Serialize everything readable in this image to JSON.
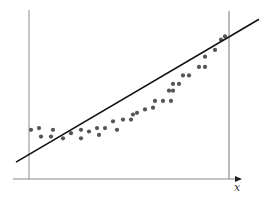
{
  "chart_data": {
    "type": "scatter",
    "title": "",
    "xlabel": "x",
    "ylabel": "",
    "grid": false,
    "legend": null,
    "xlim": [
      0,
      1
    ],
    "ylim": [
      0,
      1
    ],
    "series": [
      {
        "name": "observations",
        "kind": "points",
        "color": "#555555",
        "points": [
          [
            0.01,
            0.26
          ],
          [
            0.05,
            0.27
          ],
          [
            0.06,
            0.22
          ],
          [
            0.11,
            0.22
          ],
          [
            0.12,
            0.26
          ],
          [
            0.17,
            0.21
          ],
          [
            0.21,
            0.24
          ],
          [
            0.26,
            0.21
          ],
          [
            0.26,
            0.26
          ],
          [
            0.3,
            0.25
          ],
          [
            0.34,
            0.27
          ],
          [
            0.35,
            0.23
          ],
          [
            0.38,
            0.27
          ],
          [
            0.42,
            0.31
          ],
          [
            0.44,
            0.26
          ],
          [
            0.47,
            0.32
          ],
          [
            0.51,
            0.32
          ],
          [
            0.52,
            0.35
          ],
          [
            0.54,
            0.36
          ],
          [
            0.58,
            0.38
          ],
          [
            0.62,
            0.39
          ],
          [
            0.63,
            0.43
          ],
          [
            0.67,
            0.43
          ],
          [
            0.71,
            0.43
          ],
          [
            0.7,
            0.49
          ],
          [
            0.72,
            0.53
          ],
          [
            0.72,
            0.49
          ],
          [
            0.75,
            0.53
          ],
          [
            0.77,
            0.58
          ],
          [
            0.8,
            0.58
          ],
          [
            0.85,
            0.63
          ],
          [
            0.88,
            0.63
          ],
          [
            0.88,
            0.69
          ],
          [
            0.93,
            0.73
          ],
          [
            0.96,
            0.79
          ],
          [
            0.98,
            0.81
          ]
        ]
      },
      {
        "name": "linear fit",
        "kind": "line",
        "color": "#111111",
        "points": [
          [
            -0.065,
            0.07
          ],
          [
            1.15,
            0.91
          ]
        ]
      }
    ],
    "annotations": [
      {
        "type": "vline",
        "x": 0.0,
        "label": "",
        "color": "#999999"
      },
      {
        "type": "vline",
        "x": 1.0,
        "label": "",
        "color": "#777777"
      },
      {
        "type": "axis-arrow",
        "axis": "x",
        "label": "x"
      }
    ]
  },
  "chart": {
    "x_axis_label": "x"
  }
}
